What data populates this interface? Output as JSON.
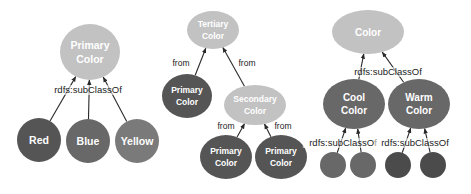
{
  "colors": {
    "light": "#c2c2c2",
    "medium": "#7a7a7a",
    "medium_dark": "#676767",
    "dark": "#555555",
    "darker": "#4c4c4c"
  },
  "diagrams": [
    {
      "name": "primary-colors",
      "nodes": [
        {
          "id": "primary",
          "lines": [
            "Primary",
            "Color"
          ],
          "tone": "light"
        },
        {
          "id": "red",
          "lines": [
            "Red"
          ],
          "tone": "dark"
        },
        {
          "id": "blue",
          "lines": [
            "Blue"
          ],
          "tone": "medium_dark"
        },
        {
          "id": "yellow",
          "lines": [
            "Yellow"
          ],
          "tone": "medium"
        }
      ],
      "edges": [
        {
          "from": "red",
          "to": "primary"
        },
        {
          "from": "blue",
          "to": "primary"
        },
        {
          "from": "yellow",
          "to": "primary"
        }
      ],
      "edge_labels": [
        "rdfs:subClassOf"
      ]
    },
    {
      "name": "tertiary-colors",
      "nodes": [
        {
          "id": "tertiary",
          "lines": [
            "Tertiary",
            "Color"
          ],
          "tone": "light"
        },
        {
          "id": "primary-a",
          "lines": [
            "Primary",
            "Color"
          ],
          "tone": "dark"
        },
        {
          "id": "secondary",
          "lines": [
            "Secondary",
            "Color"
          ],
          "tone": "light"
        },
        {
          "id": "primary-b",
          "lines": [
            "Primary",
            "Color"
          ],
          "tone": "dark"
        },
        {
          "id": "primary-c",
          "lines": [
            "Primary",
            "Color"
          ],
          "tone": "dark"
        }
      ],
      "edges": [
        {
          "from": "primary-a",
          "to": "tertiary",
          "label": "from"
        },
        {
          "from": "secondary",
          "to": "tertiary",
          "label": "from"
        },
        {
          "from": "primary-b",
          "to": "secondary",
          "label": "from"
        },
        {
          "from": "primary-c",
          "to": "secondary",
          "label": "from"
        }
      ]
    },
    {
      "name": "color-temperature",
      "nodes": [
        {
          "id": "color",
          "lines": [
            "Color"
          ],
          "tone": "light"
        },
        {
          "id": "cool",
          "lines": [
            "Cool",
            "Color"
          ],
          "tone": "medium_dark"
        },
        {
          "id": "warm",
          "lines": [
            "Warm",
            "Color"
          ],
          "tone": "medium_dark"
        },
        {
          "id": "cool-1",
          "lines": [],
          "tone": "medium_dark"
        },
        {
          "id": "cool-2",
          "lines": [],
          "tone": "medium_dark"
        },
        {
          "id": "warm-1",
          "lines": [],
          "tone": "darker"
        },
        {
          "id": "warm-2",
          "lines": [],
          "tone": "darker"
        }
      ],
      "edges": [
        {
          "from": "cool",
          "to": "color"
        },
        {
          "from": "warm",
          "to": "color"
        },
        {
          "from": "cool-1",
          "to": "cool"
        },
        {
          "from": "cool-2",
          "to": "cool"
        },
        {
          "from": "warm-1",
          "to": "warm"
        },
        {
          "from": "warm-2",
          "to": "warm"
        }
      ],
      "edge_labels": [
        "rdfs:subClassOf",
        "rdfs:subClassOf",
        "rdfs:subClassOf"
      ]
    }
  ]
}
